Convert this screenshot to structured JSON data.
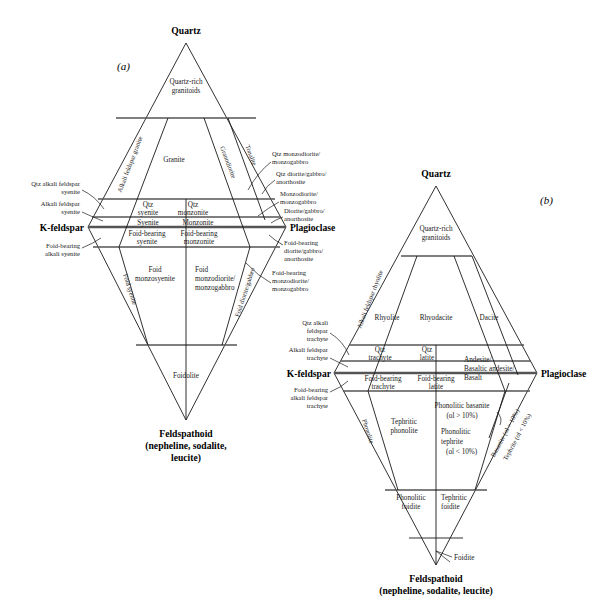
{
  "figure": {
    "panel_a_id": "(a)",
    "panel_b_id": "(b)"
  },
  "vertices": {
    "quartz": "Quartz",
    "kfeldspar": "K-feldspar",
    "plagioclase": "Plagioclase",
    "feldspathoid_line1": "Feldspathoid",
    "feldspathoid_line2": "(nepheline, sodalite,",
    "feldspathoid_line3": "leucite)",
    "feldspathoid_b_line1": "Feldspathoid",
    "feldspathoid_b_line2": "(nepheline, sodalite, leucite)"
  },
  "panel_a": {
    "fields": [
      {
        "name": "quartz-rich-granitoids",
        "line1": "Quartz-rich",
        "line2": "granitoids"
      },
      {
        "name": "granite",
        "line1": "Granite",
        "line2": ""
      },
      {
        "name": "qtz-syenite",
        "line1": "Qtz",
        "line2": "syenite"
      },
      {
        "name": "qtz-monzonite",
        "line1": "Qtz",
        "line2": "monzonite"
      },
      {
        "name": "syenite",
        "line1": "Syenite",
        "line2": ""
      },
      {
        "name": "monzonite",
        "line1": "Monzonite",
        "line2": ""
      },
      {
        "name": "foid-bearing-syenite",
        "line1": "Foid-bearing",
        "line2": "syenite"
      },
      {
        "name": "foid-bearing-monzonite",
        "line1": "Foid-bearing",
        "line2": "monzonite"
      },
      {
        "name": "foid-monzosyenite",
        "line1": "Foid",
        "line2": "monzosyenite"
      },
      {
        "name": "foid-monzodiorite",
        "line1": "Foid",
        "line2": "monzodiorite/",
        "line3": "monzogabbro"
      },
      {
        "name": "foidolite",
        "line1": "Foidolite",
        "line2": ""
      }
    ],
    "diagonals": [
      {
        "name": "alkali-feldspar-granite",
        "text": "Alkali feldspar granite"
      },
      {
        "name": "granodiorite",
        "text": "Granodiorite"
      },
      {
        "name": "tonalite",
        "text": "Tonalite"
      },
      {
        "name": "foid-syenite",
        "text": "Foid syenite"
      },
      {
        "name": "foid-diorite-gabbro",
        "text": "Foid diorite/gabbro"
      }
    ],
    "left_labels": [
      {
        "name": "qtz-alkali-feldspar-syenite",
        "lines": [
          "Qtz alkali feldspar",
          "syenite"
        ]
      },
      {
        "name": "alkali-feldspar-syenite",
        "lines": [
          "Alkali feldspar",
          "syenite"
        ]
      },
      {
        "name": "foid-bearing-alkali-syenite",
        "lines": [
          "Foid-bearing",
          "alkali syenite"
        ]
      }
    ],
    "right_labels": [
      {
        "name": "qtz-monzodiorite-monzogabbro",
        "lines": [
          "Qtz monzodiorite/",
          "monzogabbro"
        ]
      },
      {
        "name": "qtz-diorite-gabbro-anorthosite",
        "lines": [
          "Qtz diorite/gabbro/",
          "anorthosite"
        ]
      },
      {
        "name": "monzodiorite-monzogabbro",
        "lines": [
          "Monzodiorite/",
          "monzogabbro"
        ]
      },
      {
        "name": "diorite-gabbro-anorthosite",
        "lines": [
          "Diorite/gabbro/",
          "anorthosite"
        ]
      },
      {
        "name": "foid-bearing-diorite-gabbro-anorthosite",
        "lines": [
          "Foid-bearing",
          "diorite/gabbro/",
          "anorthosite"
        ]
      },
      {
        "name": "foid-bearing-monzodiorite-monzogabbro",
        "lines": [
          "Foid-bearing",
          "monzodiorite/",
          "monzogabbro"
        ]
      }
    ]
  },
  "panel_b": {
    "fields": [
      {
        "name": "quartz-rich-granitoids",
        "line1": "Quartz-rich",
        "line2": "granitoids"
      },
      {
        "name": "rhyolite",
        "line1": "Rhyolite",
        "line2": ""
      },
      {
        "name": "rhyodacite",
        "line1": "Rhyodacite",
        "line2": ""
      },
      {
        "name": "dacite",
        "line1": "Dacite",
        "line2": ""
      },
      {
        "name": "qtz-trachyte",
        "line1": "Qtz",
        "line2": "trachyte"
      },
      {
        "name": "qtz-latite",
        "line1": "Qtz",
        "line2": "latite"
      },
      {
        "name": "andesite-basalt",
        "line1": "Andesite/",
        "line2": "Basaltic andesite/",
        "line3": "Basalt"
      },
      {
        "name": "foid-bearing-trachyte",
        "line1": "Foid-bearing",
        "line2": "trachyte"
      },
      {
        "name": "foid-bearing-latite",
        "line1": "Foid-bearing",
        "line2": "latite"
      },
      {
        "name": "tephritic-phonolite",
        "line1": "Tephritic",
        "line2": "phonolite"
      },
      {
        "name": "phonolitic-basanite",
        "line1": "Phonolitic basanite",
        "line2": "(ol > 10%)"
      },
      {
        "name": "phonolitic-tephrite",
        "line1": "Phonolitic",
        "line2": "tephrite",
        "line3": "(ol < 10%)"
      },
      {
        "name": "phonolitic-foidite",
        "line1": "Phonolitic",
        "line2": "foidite"
      },
      {
        "name": "tephritic-foidite",
        "line1": "Tephritic",
        "line2": "foidite"
      },
      {
        "name": "foidite",
        "line1": "Foidite",
        "line2": ""
      }
    ],
    "diagonals": [
      {
        "name": "alkali-feldspar-rhyolite",
        "text": "Alkali feldspar rhyolite"
      },
      {
        "name": "phonolite",
        "text": "Phonolite"
      },
      {
        "name": "basanite",
        "text": "Basanite (ol > 10%)"
      },
      {
        "name": "tephrite",
        "text": "Tephrite (ol < 10%)"
      }
    ],
    "left_labels": [
      {
        "name": "qtz-alkali-feldspar-trachyte",
        "lines": [
          "Qtz alkali",
          "feldspar",
          "trachyte"
        ]
      },
      {
        "name": "alkali-feldspar-trachyte",
        "lines": [
          "Alkali feldspar",
          "trachyte"
        ]
      },
      {
        "name": "foid-bearing-alkali-feldspar-trachyte",
        "lines": [
          "Foid-bearing",
          "alkali feldspar",
          "trachyte"
        ]
      }
    ]
  }
}
